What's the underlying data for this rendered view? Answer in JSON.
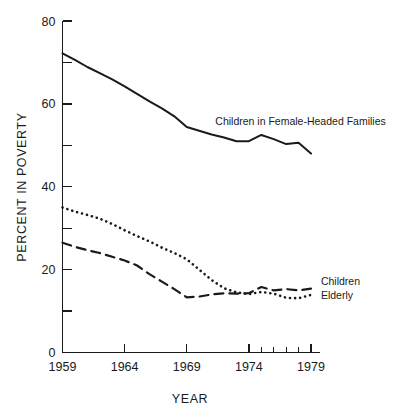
{
  "chart_data": {
    "type": "line",
    "title": "",
    "xlabel": "YEAR",
    "ylabel": "PERCENT IN POVERTY",
    "xlim": [
      1959,
      1979
    ],
    "ylim": [
      0,
      80
    ],
    "grid": false,
    "legend": "inline-annotations",
    "x_ticks_major": [
      "1959",
      "1964",
      "1969",
      "1974",
      "1979"
    ],
    "x_ticks_major_values": [
      1959,
      1964,
      1969,
      1974,
      1979
    ],
    "x_ticks_minor_values": [
      1975,
      1976,
      1977,
      1978
    ],
    "y_ticks_labeled": [
      "0",
      "20",
      "40",
      "60",
      "80"
    ],
    "y_ticks_labeled_values": [
      0,
      20,
      40,
      60,
      80
    ],
    "y_ticks_minor_values": [
      10,
      30,
      50,
      70
    ],
    "x": [
      1959,
      1960,
      1961,
      1962,
      1963,
      1964,
      1965,
      1966,
      1967,
      1968,
      1969,
      1970,
      1971,
      1972,
      1973,
      1974,
      1975,
      1976,
      1977,
      1978,
      1979
    ],
    "series": [
      {
        "name": "Children in Female-Headed Families",
        "style": "solid",
        "label_x": 1971.3,
        "label_y": 55.0,
        "values": [
          72.2,
          70.6,
          68.9,
          67.4,
          65.9,
          64.2,
          62.4,
          60.6,
          58.9,
          57.0,
          54.4,
          53.5,
          52.6,
          51.9,
          51.0,
          51.0,
          52.5,
          51.5,
          50.3,
          50.6,
          48.0
        ]
      },
      {
        "name": "Children",
        "style": "dashed",
        "label_x": 1979.8,
        "label_y": 16.3,
        "values": [
          26.5,
          25.5,
          24.7,
          24.0,
          23.1,
          22.2,
          21.0,
          18.9,
          17.1,
          15.3,
          13.3,
          13.5,
          14.0,
          14.3,
          14.2,
          14.3,
          15.8,
          15.0,
          15.3,
          15.0,
          15.4
        ]
      },
      {
        "name": "Elderly",
        "style": "dotted",
        "label_x": 1979.8,
        "label_y": 12.8,
        "values": [
          35.0,
          34.0,
          33.2,
          32.3,
          31.0,
          29.5,
          28.1,
          26.8,
          25.3,
          24.0,
          22.5,
          20.0,
          17.5,
          15.5,
          14.5,
          14.1,
          14.6,
          14.2,
          13.2,
          13.1,
          13.9
        ]
      }
    ]
  },
  "annotations": {
    "series_label_0": "Children in Female-Headed Families",
    "series_label_1": "Children",
    "series_label_2": "Elderly"
  },
  "axes": {
    "x_title": "YEAR",
    "y_title": "PERCENT IN POVERTY"
  },
  "colors": {
    "ink": "#1a1a1a",
    "background": "#ffffff"
  }
}
